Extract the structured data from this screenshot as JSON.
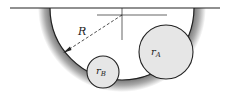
{
  "diagram": {
    "labels": {
      "bowl_radius": "R",
      "circle_a": "r",
      "circle_a_sub": "A",
      "circle_b": "r",
      "circle_b_sub": "B"
    },
    "colors": {
      "line": "#222222",
      "circle_fill": "#e6e6e6",
      "bowl_shadow": "#9a9a9a"
    }
  }
}
